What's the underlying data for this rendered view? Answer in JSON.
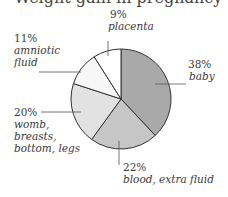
{
  "title": "Weight gain in pregnancy",
  "chart_data": {
    "type": "pie",
    "title": "Weight gain in pregnancy",
    "start_angle": "12 o'clock, clockwise",
    "slices": [
      {
        "label": "baby",
        "value": 38,
        "pct_label": "38%",
        "color": "#a9a9a9"
      },
      {
        "label": "blood, extra fluid",
        "value": 22,
        "pct_label": "22%",
        "color": "#c6c6c6"
      },
      {
        "label": "womb, breasts, bottom, legs",
        "value": 20,
        "pct_label": "20%",
        "color": "#e2e2e2"
      },
      {
        "label": "amniotic fluid",
        "value": 11,
        "pct_label": "11%",
        "color": "#f7f7f7"
      },
      {
        "label": "placenta",
        "value": 9,
        "pct_label": "9%",
        "color": "#ffffff"
      }
    ],
    "legend": "none (leader-line labels)"
  },
  "labels": {
    "baby": {
      "pct": "38%",
      "line1": "baby"
    },
    "blood": {
      "pct": "22%",
      "line1": "blood, extra fluid"
    },
    "womb": {
      "pct": "20%",
      "line1": "womb,",
      "line2": "breasts,",
      "line3": "bottom, legs"
    },
    "amniotic": {
      "pct": "11%",
      "line1": "amniotic",
      "line2": "fluid"
    },
    "placenta": {
      "pct": "9%",
      "line1": "placenta"
    }
  }
}
